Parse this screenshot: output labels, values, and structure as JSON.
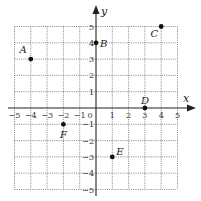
{
  "diagram": {
    "type": "coordinate-plane",
    "x_range": [
      -5,
      5
    ],
    "y_range": [
      -5,
      5
    ],
    "x_axis_label": "x",
    "y_axis_label": "y",
    "x_ticks": [
      "−5",
      "−4",
      "−3",
      "−2",
      "−1",
      "0",
      "1",
      "2",
      "3",
      "4",
      "5"
    ],
    "y_ticks": [
      "5",
      "4",
      "3",
      "2",
      "1",
      "−1",
      "−2",
      "−3",
      "−4",
      "−5"
    ],
    "points": [
      {
        "label": "A",
        "x": -4,
        "y": 3
      },
      {
        "label": "B",
        "x": 0,
        "y": 4
      },
      {
        "label": "C",
        "x": 4,
        "y": 5
      },
      {
        "label": "D",
        "x": 3,
        "y": 0
      },
      {
        "label": "E",
        "x": 1,
        "y": -3
      },
      {
        "label": "F",
        "x": -2,
        "y": -1
      }
    ],
    "colors": {
      "grid": "#666666",
      "axis": "#222222",
      "point": "#111111",
      "background": "#ffffff"
    }
  }
}
